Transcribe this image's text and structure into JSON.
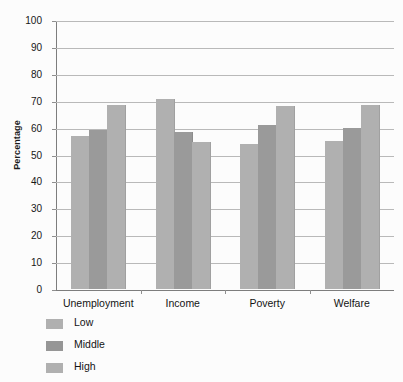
{
  "chart_data": {
    "type": "bar",
    "title": "",
    "xlabel": "",
    "ylabel": "Percentage",
    "ylim": [
      0,
      100
    ],
    "ytick_step": 10,
    "yticks": [
      100,
      90,
      80,
      70,
      60,
      50,
      40,
      30,
      20,
      10,
      0
    ],
    "grid": true,
    "grid_axis": "y",
    "legend_position": "below-left",
    "categories": [
      "Unemployment",
      "Income",
      "Poverty",
      "Welfare"
    ],
    "series": [
      {
        "name": "Low",
        "color": "#b0b0b0",
        "values": [
          57,
          70.5,
          54,
          55
        ]
      },
      {
        "name": "Middle",
        "color": "#969696",
        "values": [
          59,
          58.5,
          61,
          60
        ]
      },
      {
        "name": "High",
        "color": "#b0b0b0",
        "values": [
          68.5,
          54.5,
          68,
          68.5
        ]
      }
    ]
  },
  "axis": {
    "y_title": "Percentage"
  },
  "legend": {
    "items": [
      {
        "label": "Low"
      },
      {
        "label": "Middle"
      },
      {
        "label": "High"
      }
    ]
  },
  "colors": {
    "bar_light": "#b0b0b0",
    "bar_dark": "#969696",
    "gridline": "#b9b9b9",
    "axis": "#7d7d7d",
    "text": "#141414",
    "background": "#fcfcfc"
  }
}
